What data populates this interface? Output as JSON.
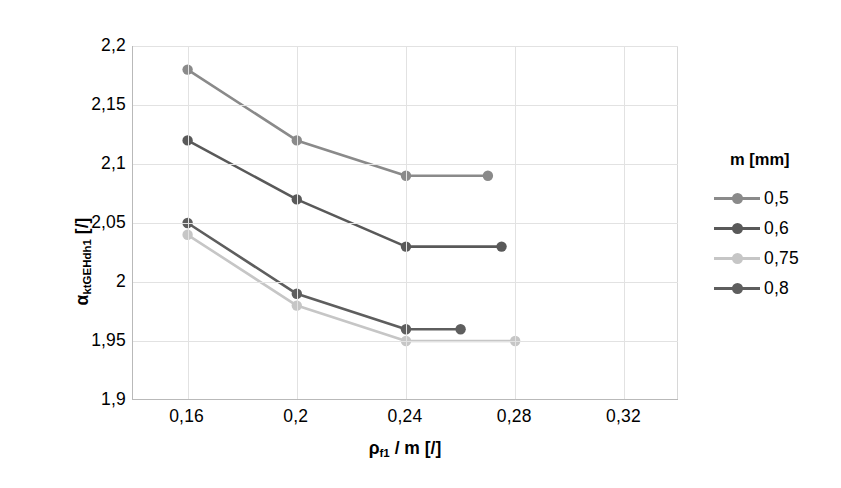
{
  "chart_data": {
    "type": "line",
    "title": "",
    "xlabel": "ρf1 / m [/]",
    "ylabel": "αktGEHdh1 [/]",
    "xlim": [
      0.14,
      0.34
    ],
    "ylim": [
      1.9,
      2.2
    ],
    "xticks": [
      "0,16",
      "0,2",
      "0,24",
      "0,28",
      "0,32"
    ],
    "xtick_values": [
      0.16,
      0.2,
      0.24,
      0.28,
      0.32
    ],
    "yticks": [
      "1,9",
      "1,95",
      "2",
      "2,05",
      "2,1",
      "2,15",
      "2,2"
    ],
    "ytick_values": [
      1.9,
      1.95,
      2.0,
      2.05,
      2.1,
      2.15,
      2.2
    ],
    "grid": true,
    "legend_position": "right",
    "legend_title": "m [mm]",
    "series": [
      {
        "name": "0,5",
        "color": "#8a8a8a",
        "x": [
          0.16,
          0.2,
          0.24,
          0.27
        ],
        "values": [
          2.18,
          2.12,
          2.09,
          2.09
        ]
      },
      {
        "name": "0,6",
        "color": "#595959",
        "x": [
          0.16,
          0.2,
          0.24,
          0.275
        ],
        "values": [
          2.12,
          2.07,
          2.03,
          2.03
        ]
      },
      {
        "name": "0,75",
        "color": "#c6c6c6",
        "x": [
          0.16,
          0.2,
          0.24,
          0.28
        ],
        "values": [
          2.04,
          1.98,
          1.95,
          1.95
        ]
      },
      {
        "name": "0,8",
        "color": "#5e5e5e",
        "x": [
          0.16,
          0.2,
          0.24,
          0.26
        ],
        "values": [
          2.05,
          1.99,
          1.96,
          1.96
        ]
      }
    ]
  },
  "axis": {
    "x_title_symbol": "ρ",
    "x_title_sub": "f1",
    "x_title_rest": " / m [/]",
    "y_title_symbol": "α",
    "y_title_sub": "ktGEHdh1",
    "y_title_rest": " [/]"
  },
  "legend": {
    "title": "m [mm]",
    "items": [
      {
        "label": "0,5",
        "color": "#8a8a8a"
      },
      {
        "label": "0,6",
        "color": "#595959"
      },
      {
        "label": "0,75",
        "color": "#c6c6c6"
      },
      {
        "label": "0,8",
        "color": "#5e5e5e"
      }
    ]
  }
}
